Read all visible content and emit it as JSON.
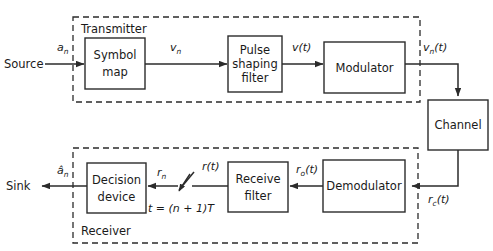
{
  "diagram": {
    "groups": [
      {
        "id": "transmitter",
        "label": "Transmitter"
      },
      {
        "id": "receiver",
        "label": "Receiver"
      }
    ],
    "endpoints": [
      {
        "id": "source",
        "label": "Source"
      },
      {
        "id": "sink",
        "label": "Sink"
      }
    ],
    "blocks": [
      {
        "id": "symbol-map",
        "line1": "Symbol",
        "line2": "map"
      },
      {
        "id": "pulse-shaping-filter",
        "line1": "Pulse",
        "line2": "shaping",
        "line3": "filter"
      },
      {
        "id": "modulator",
        "line1": "Modulator"
      },
      {
        "id": "channel",
        "line1": "Channel"
      },
      {
        "id": "demodulator",
        "line1": "Demodulator"
      },
      {
        "id": "receive-filter",
        "line1": "Receive",
        "line2": "filter"
      },
      {
        "id": "decision-device",
        "line1": "Decision",
        "line2": "device"
      }
    ],
    "signals": [
      {
        "id": "a-n",
        "base": "a",
        "sub": "n",
        "suffix": ""
      },
      {
        "id": "v-n",
        "base": "v",
        "sub": "n",
        "suffix": ""
      },
      {
        "id": "v-of-t",
        "base": "v",
        "sub": "",
        "suffix": "(t)"
      },
      {
        "id": "v-n-of-t",
        "base": "v",
        "sub": "n",
        "suffix": "(t)"
      },
      {
        "id": "r-c-of-t",
        "base": "r",
        "sub": "c",
        "suffix": "(t)"
      },
      {
        "id": "r-o-of-t",
        "base": "r",
        "sub": "o",
        "suffix": "(t)"
      },
      {
        "id": "r-of-t",
        "base": "r",
        "sub": "",
        "suffix": "(t)"
      },
      {
        "id": "r-n",
        "base": "r",
        "sub": "n",
        "suffix": ""
      },
      {
        "id": "a-hat-n",
        "base": "â",
        "sub": "n",
        "suffix": ""
      }
    ],
    "annotations": [
      {
        "id": "sampling-instant",
        "text": "t = (n + 1)T"
      }
    ],
    "colors": {
      "stroke": "#2b2b2b",
      "background": "#ffffff",
      "text": "#1a1a1a"
    }
  }
}
